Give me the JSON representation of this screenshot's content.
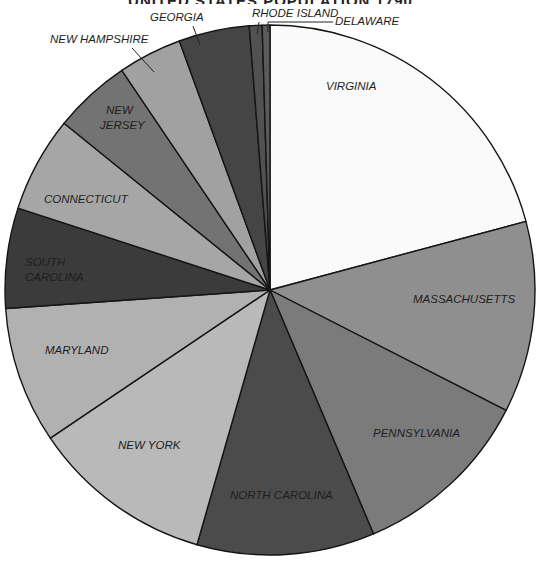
{
  "chart_data": {
    "type": "pie",
    "title": "UNITED STATES POPULATION 1790",
    "title_clipped": true,
    "center": [
      270,
      290
    ],
    "radius": 265,
    "start_angle_deg": 0,
    "direction": "clockwise",
    "slices": [
      {
        "label": "VIRGINIA",
        "sweep_deg": 75.0,
        "percent": 20.8,
        "color": "#fafafa",
        "label_pos": [
          326,
          90
        ],
        "label_color": "#2a2a2a"
      },
      {
        "label": "MASSACHUSETTS",
        "sweep_deg": 42.0,
        "percent": 11.7,
        "color": "#8f8f8f",
        "label_pos": [
          413,
          303
        ]
      },
      {
        "label": "PENNSYLVANIA",
        "sweep_deg": 40.0,
        "percent": 11.1,
        "color": "#7b7b7b",
        "label_pos": [
          373,
          437
        ]
      },
      {
        "label": "NORTH CAROLINA",
        "sweep_deg": 39.0,
        "percent": 10.8,
        "color": "#4b4b4b",
        "label_pos": [
          230,
          499
        ]
      },
      {
        "label": "NEW YORK",
        "sweep_deg": 40.0,
        "percent": 11.1,
        "color": "#b9b9b9",
        "label_pos": [
          118,
          449
        ]
      },
      {
        "label": "MARYLAND",
        "sweep_deg": 30.0,
        "percent": 8.3,
        "color": "#b1b1b1",
        "label_pos": [
          45,
          354
        ]
      },
      {
        "label": "SOUTH CAROLINA",
        "sweep_deg": 22.0,
        "percent": 6.1,
        "color": "#3b3b3b",
        "label_pos": [
          25,
          266
        ],
        "multiline": [
          "SOUTH",
          "CAROLINA"
        ]
      },
      {
        "label": "CONNECTICUT",
        "sweep_deg": 21.0,
        "percent": 5.8,
        "color": "#a6a6a6",
        "label_pos": [
          44,
          203
        ]
      },
      {
        "label": "NEW JERSEY",
        "sweep_deg": 17.0,
        "percent": 4.7,
        "color": "#737373",
        "label_pos": [
          100,
          114
        ],
        "multiline": [
          "NEW",
          "JERSEY"
        ]
      },
      {
        "label": "NEW HAMPSHIRE",
        "sweep_deg": 14.0,
        "percent": 3.9,
        "color": "#a1a1a1",
        "label_pos": [
          50,
          43
        ],
        "leader": [
          [
            132,
            48
          ],
          [
            154,
            72
          ]
        ]
      },
      {
        "label": "GEORGIA",
        "sweep_deg": 15.5,
        "percent": 4.3,
        "color": "#454545",
        "label_pos": [
          150,
          21
        ],
        "leader": [
          [
            193,
            26
          ],
          [
            200,
            45
          ]
        ]
      },
      {
        "label": "RHODE ISLAND",
        "sweep_deg": 2.8,
        "percent": 0.8,
        "color": "#515151",
        "label_pos": [
          252,
          17
        ],
        "leader": [
          [
            259,
            22
          ],
          [
            257,
            34
          ]
        ]
      },
      {
        "label": "DELAWARE",
        "sweep_deg": 1.7,
        "percent": 0.5,
        "color": "#5b5b5b",
        "label_pos": [
          335,
          25
        ],
        "leader": [
          [
            268,
            32
          ],
          [
            268,
            22
          ],
          [
            333,
            22
          ]
        ]
      }
    ]
  }
}
